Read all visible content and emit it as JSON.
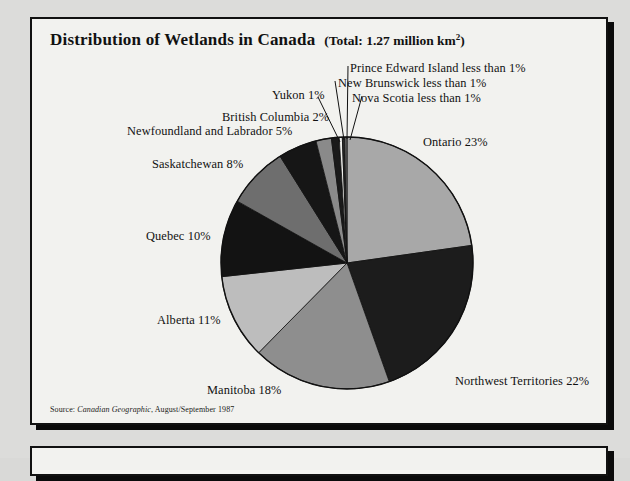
{
  "chart_data": {
    "type": "pie",
    "title": "Distribution of Wetlands in Canada",
    "subtitle_prefix": "(Total: 1.27 million km",
    "subtitle_sup": "2",
    "subtitle_suffix": ")",
    "xlabel": "",
    "ylabel": "",
    "legend_position": "callout-labels",
    "grid": false,
    "categories": [
      "Ontario",
      "Northwest Territories",
      "Manitoba",
      "Alberta",
      "Quebec",
      "Saskatchewan",
      "Newfoundland and Labrador",
      "British Columbia",
      "Yukon",
      "Nova Scotia",
      "New Brunswick",
      "Prince Edward Island"
    ],
    "values": [
      23,
      22,
      18,
      11,
      10,
      8,
      5,
      2,
      1,
      0.4,
      0.3,
      0.3
    ],
    "labels": [
      "Ontario 23%",
      "Northwest Territories 22%",
      "Manitoba 18%",
      "Alberta 11%",
      "Quebec 10%",
      "Saskatchewan 8%",
      "Newfoundland and Labrador 5%",
      "British Columbia 2%",
      "Yukon 1%",
      "Nova Scotia less than 1%",
      "New Brunswick less than 1%",
      "Prince Edward Island less than 1%"
    ],
    "slice_colors": [
      "#a8a8a8",
      "#1c1c1c",
      "#8e8e8e",
      "#bdbdbd",
      "#131313",
      "#6e6e6e",
      "#161616",
      "#8a8a8a",
      "#1a1a1a",
      "#efefec",
      "#2a2a2a",
      "#6a6a6a"
    ]
  },
  "source": {
    "prefix": "Source:",
    "journal": "Canadian Geographic",
    "rest": ", August/September 1987"
  }
}
